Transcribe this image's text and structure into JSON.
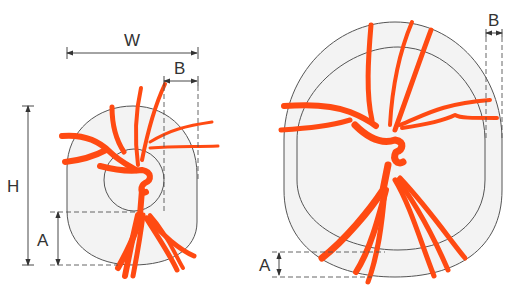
{
  "figure": {
    "left_disc": {
      "labels": {
        "width": "W",
        "rim_b": "B",
        "height": "H",
        "rim_a": "A"
      }
    },
    "right_disc": {
      "labels": {
        "rim_b": "B",
        "rim_a": "A"
      }
    },
    "colors": {
      "vessel": "#ff4a12",
      "disc_fill": "#f3f3f3",
      "outline": "#555555"
    }
  }
}
